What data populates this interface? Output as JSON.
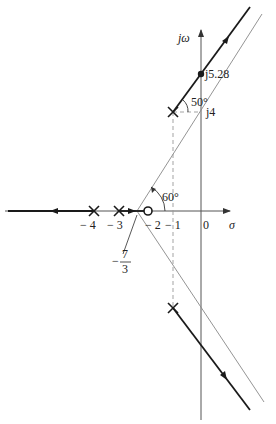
{
  "diagram": {
    "type": "root-locus",
    "axes": {
      "imag_label": "jω",
      "real_label": "σ",
      "origin_label": "0"
    },
    "real_axis_ticks": [
      {
        "label": "− 4",
        "value": -4
      },
      {
        "label": "− 3",
        "value": -3
      },
      {
        "label": "− 2",
        "value": -2
      },
      {
        "label": "− 1",
        "value": -1
      }
    ],
    "annotations": {
      "crossing": "j5.28",
      "imag_ref": "j4",
      "departure_angle": "50°",
      "asymptote_angle": "60°",
      "breakaway_num": "7",
      "breakaway_den": "3",
      "breakaway_sign": "−"
    },
    "poles": [
      {
        "re": -4,
        "im": 0
      },
      {
        "re": -3,
        "im": 0
      },
      {
        "re": -1,
        "im": 4
      },
      {
        "re": -1,
        "im": -4
      }
    ],
    "zeros": [
      {
        "re": -2,
        "im": 0
      }
    ],
    "colors": {
      "locus": "#1a1a1a",
      "axis": "#555555",
      "asymptote": "#777777",
      "dashed": "#888888"
    }
  }
}
